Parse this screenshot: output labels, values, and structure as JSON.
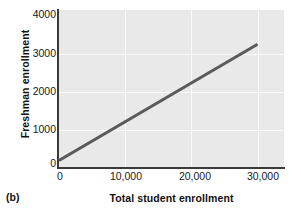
{
  "panel": {
    "label": "(b)"
  },
  "chart_data": {
    "type": "line",
    "title": "",
    "subtitle": "",
    "xlabel": "Total student enrollment",
    "ylabel": "Freshman enrollment",
    "xlim": [
      0,
      34000
    ],
    "ylim": [
      0,
      4150
    ],
    "xticks": [
      0,
      10000,
      20000,
      30000
    ],
    "xtick_labels": [
      "0",
      "10,000",
      "20,000",
      "30,000"
    ],
    "yticks": [
      0,
      1000,
      2000,
      3000,
      4000
    ],
    "ytick_labels": [
      "0",
      "1000",
      "2000",
      "3000",
      "4000"
    ],
    "grid": true,
    "grid_color": "#fafafa",
    "legend": false,
    "plot_background": "#e9e9e9",
    "series": [
      {
        "name": "regression-line",
        "kind": "line",
        "color": "#5a5a5a",
        "linewidth": 3,
        "x": [
          0,
          30000
        ],
        "values": [
          200,
          3250
        ]
      }
    ],
    "annotations": []
  }
}
